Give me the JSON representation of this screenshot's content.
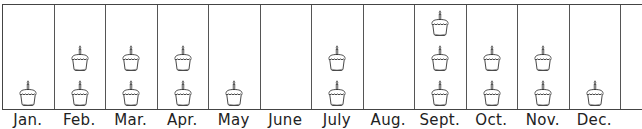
{
  "chart_data": {
    "type": "pictograph",
    "title": "",
    "categories": [
      "Jan.",
      "Feb.",
      "Mar.",
      "Apr.",
      "May",
      "June",
      "July",
      "Aug.",
      "Sept.",
      "Oct.",
      "Nov.",
      "Dec."
    ],
    "values": [
      1,
      2,
      2,
      2,
      1,
      0,
      2,
      0,
      3,
      2,
      2,
      1
    ],
    "icon": "cupcake-icon",
    "xlabel": "",
    "ylabel": "",
    "grid": true,
    "legend": null
  },
  "months": [
    {
      "label": "Jan.",
      "count": 1
    },
    {
      "label": "Feb.",
      "count": 2
    },
    {
      "label": "Mar.",
      "count": 2
    },
    {
      "label": "Apr.",
      "count": 2
    },
    {
      "label": "May",
      "count": 1
    },
    {
      "label": "June",
      "count": 0
    },
    {
      "label": "July",
      "count": 2
    },
    {
      "label": "Aug.",
      "count": 0
    },
    {
      "label": "Sept.",
      "count": 3
    },
    {
      "label": "Oct.",
      "count": 2
    },
    {
      "label": "Nov.",
      "count": 2
    },
    {
      "label": "Dec.",
      "count": 1
    }
  ],
  "colors": {
    "line": "#444444",
    "text": "#222222"
  }
}
